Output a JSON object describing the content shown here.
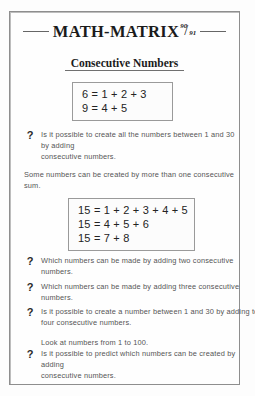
{
  "document": {
    "title": "MATH-MATRIX",
    "issue_numerator": "90",
    "issue_slash": "/",
    "issue_denominator": "91",
    "subtitle": "Consecutive Numbers",
    "question_marker": "?"
  },
  "boxes": [
    {
      "name": "first-example-box",
      "lines": [
        "6 = 1 + 2 + 3",
        "9 = 4 + 5"
      ]
    },
    {
      "name": "second-example-box",
      "lines": [
        "15 = 1 + 2 + 3 + 4 + 5",
        "15 = 4 + 5 + 6",
        "15 = 7 + 8"
      ]
    }
  ],
  "content": {
    "question_1": {
      "line1": "Is it possible to create all the numbers between 1 and 30 by adding",
      "line2": "consecutive numbers."
    },
    "statement_1": "Some numbers can be created by more than one consecutive sum.",
    "question_2": "Which numbers can be made by adding two consecutive numbers.",
    "question_3": "Which numbers can be made by adding three consecutive numbers.",
    "question_4": {
      "line1": "Is it possible to create a number between 1 and 30 by adding togeth",
      "line2": "four consecutive numbers."
    },
    "question_5": {
      "lead": "Look at numbers from 1 to 100.",
      "line1": "Is it possible to predict which numbers can be created by adding",
      "line2": "consecutive numbers."
    }
  }
}
